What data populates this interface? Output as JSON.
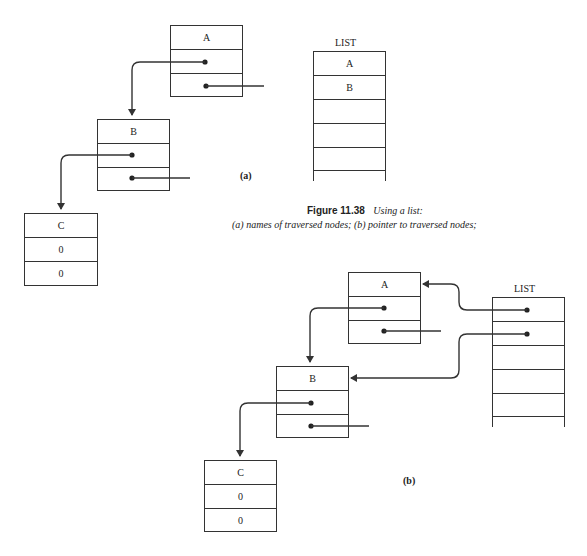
{
  "figure": {
    "number": "Figure 11.38",
    "title": "Using a list:",
    "subtitle": "(a) names of traversed nodes; (b) pointer to traversed nodes;"
  },
  "part_a": {
    "label": "(a)",
    "nodes": [
      {
        "name": "A",
        "fields": [
          "A",
          "",
          ""
        ]
      },
      {
        "name": "B",
        "fields": [
          "B",
          "",
          ""
        ]
      },
      {
        "name": "C",
        "fields": [
          "C",
          "0",
          "0"
        ]
      }
    ],
    "list": {
      "label": "LIST",
      "cells": [
        "A",
        "B",
        "",
        "",
        "",
        ""
      ]
    }
  },
  "part_b": {
    "label": "(b)",
    "nodes": [
      {
        "name": "A",
        "fields": [
          "A",
          "",
          ""
        ]
      },
      {
        "name": "B",
        "fields": [
          "B",
          "",
          ""
        ]
      },
      {
        "name": "C",
        "fields": [
          "C",
          "0",
          "0"
        ]
      }
    ],
    "list": {
      "label": "LIST",
      "cells": [
        "",
        "",
        "",
        "",
        "",
        ""
      ]
    }
  }
}
